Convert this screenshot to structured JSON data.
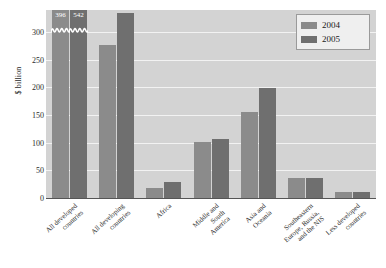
{
  "chart_data": {
    "type": "bar",
    "title": "",
    "xlabel": "",
    "ylabel": "$ billion",
    "ylim": [
      0,
      340
    ],
    "yticks": [
      0,
      50,
      100,
      150,
      200,
      250,
      300
    ],
    "grid": true,
    "legend_position": "top-right",
    "axis_break_note": "Bars for 'All developed countries' exceed the axis maximum and are truncated with a zigzag break; their true values are printed on the bars.",
    "categories": [
      "All developed countries",
      "All developing countries",
      "Africa",
      "Middle and South America",
      "Asia and Oceania",
      "Southeastern Europe, Russia, and the NIS",
      "Less developed countries"
    ],
    "series": [
      {
        "name": "2004",
        "color": "#8b8b8b",
        "values": [
          396,
          277,
          18,
          101,
          156,
          36,
          10
        ]
      },
      {
        "name": "2005",
        "color": "#6f6f6f",
        "values": [
          542,
          334,
          29,
          106,
          199,
          36,
          10
        ]
      }
    ],
    "data_labels": [
      {
        "category": "All developed countries",
        "series": "2004",
        "text": "396"
      },
      {
        "category": "All developed countries",
        "series": "2005",
        "text": "542"
      }
    ]
  },
  "legend": {
    "items": [
      {
        "label": "2004",
        "swatch": "#8b8b8b"
      },
      {
        "label": "2005",
        "swatch": "#6f6f6f"
      }
    ]
  },
  "colors": {
    "plot_background": "#d3d3d3",
    "gridline": "#f2f2f2",
    "axis": "#555555",
    "series_2004": "#8b8b8b",
    "series_2005": "#6f6f6f",
    "legend_background": "#efefef",
    "legend_border": "#9a9a9a",
    "text": "#2b2b2b",
    "data_label_text": "#ffffff"
  }
}
